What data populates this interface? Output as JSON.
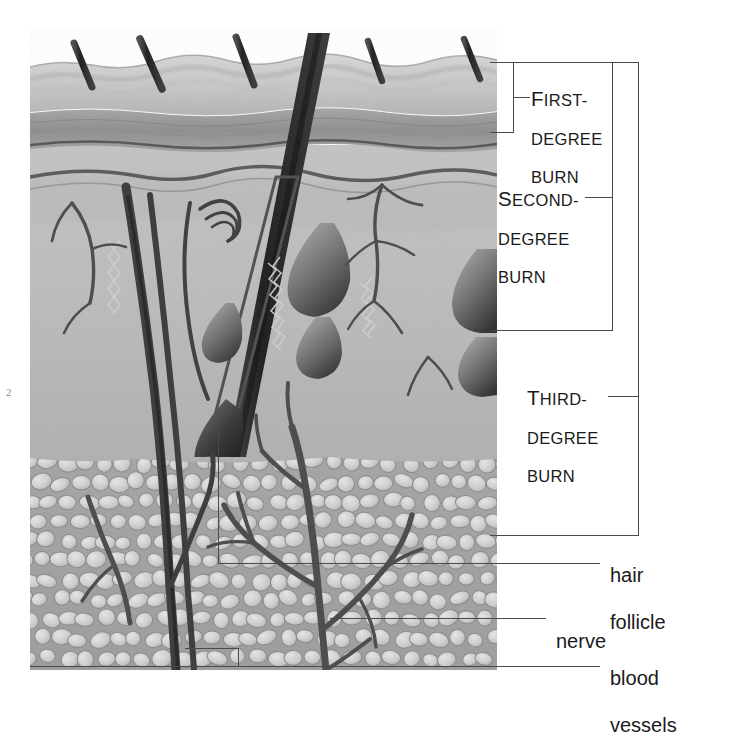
{
  "figure": {
    "type": "anatomical-cross-section",
    "layers": [
      {
        "name": "epidermis",
        "depth_label": "first-degree burn"
      },
      {
        "name": "dermis",
        "depth_label": "second-degree burn"
      },
      {
        "name": "subcutaneous fat",
        "depth_label": "third-degree burn"
      }
    ]
  },
  "burn_labels": [
    {
      "id": "first",
      "line1_cap": "F",
      "line1_rest": "IRST-",
      "line2": "DEGREE",
      "line3": "BURN"
    },
    {
      "id": "second",
      "line1_cap": "S",
      "line1_rest": "ECOND-",
      "line2": "DEGREE",
      "line3": "BURN"
    },
    {
      "id": "third",
      "line1_cap": "T",
      "line1_rest": "HIRD-",
      "line2": "DEGREE",
      "line3": "BURN"
    }
  ],
  "structure_labels": [
    {
      "id": "hair-follicle",
      "line1": "hair",
      "line2": "follicle"
    },
    {
      "id": "nerve",
      "line1": "nerve",
      "line2": ""
    },
    {
      "id": "blood-vessels",
      "line1": "blood",
      "line2": "vessels"
    }
  ],
  "page_artifact": "2",
  "colors": {
    "epidermis_top": "#cfcfcf",
    "epidermis_band": "#9a9a9a",
    "dermis": "#bdbdbd",
    "subcutaneous": "#a8a8a8",
    "fat_lobule": "#d8d8d8",
    "ink_dark": "#3b3b3b",
    "hair_shaft": "#2e2e2e",
    "rule": "#4a4a4a",
    "text": "#1a1a1a",
    "background": "#ffffff"
  }
}
